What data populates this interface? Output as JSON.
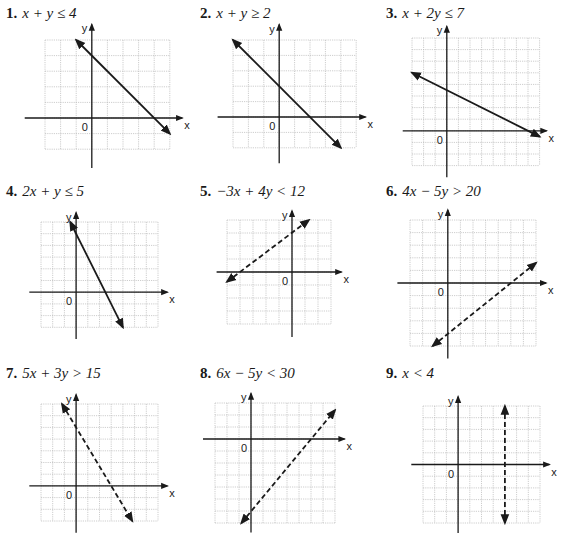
{
  "problems": [
    {
      "number": "1.",
      "expression": "x + y ≤ 4",
      "line_style": "solid",
      "label_pos": [
        6,
        5
      ],
      "grid": {
        "left": 45,
        "top": 40,
        "cell": 15.6,
        "xmin": -3,
        "xmax": 5,
        "ymin": -2,
        "ymax": 5,
        "axis_x_ext": [
          -4.3,
          5.8
        ],
        "axis_y_ext": [
          -3.2,
          6.0
        ]
      },
      "line": {
        "p1": [
          -1,
          5
        ],
        "p2": [
          5,
          -1
        ]
      }
    },
    {
      "number": "2.",
      "expression": "x + y ≥ 2",
      "line_style": "solid",
      "label_pos": [
        200,
        5
      ],
      "grid": {
        "left": 233,
        "top": 40,
        "cell": 15.4,
        "xmin": -3,
        "xmax": 5,
        "ymin": -2,
        "ymax": 5,
        "axis_x_ext": [
          -4.0,
          5.6
        ],
        "axis_y_ext": [
          -3.0,
          6.0
        ]
      },
      "line": {
        "p1": [
          -3,
          5
        ],
        "p2": [
          4,
          -2
        ]
      }
    },
    {
      "number": "3.",
      "expression": "x + 2y ≤ 7",
      "line_style": "solid",
      "label_pos": [
        386,
        5
      ],
      "grid": {
        "left": 412,
        "top": 38,
        "cell": 11.6,
        "xmin": -3,
        "xmax": 8,
        "ymin": -3,
        "ymax": 8,
        "axis_x_ext": [
          -3.8,
          8.6
        ],
        "axis_y_ext": [
          -4.0,
          9.0
        ]
      },
      "line": {
        "p1": [
          -3,
          5
        ],
        "p2": [
          8,
          -0.5
        ]
      }
    },
    {
      "number": "4.",
      "expression": "2x + y ≤ 5",
      "line_style": "solid",
      "label_pos": [
        6,
        183
      ],
      "grid": {
        "left": 41,
        "top": 222,
        "cell": 11.7,
        "xmin": -3,
        "xmax": 7,
        "ymin": -3,
        "ymax": 6,
        "axis_x_ext": [
          -4.0,
          7.8
        ],
        "axis_y_ext": [
          -4.0,
          6.8
        ]
      },
      "line": {
        "p1": [
          -0.5,
          6
        ],
        "p2": [
          4,
          -3
        ]
      }
    },
    {
      "number": "5.",
      "expression": "−3x + 4y < 12",
      "line_style": "dashed",
      "label_pos": [
        200,
        183
      ],
      "grid": {
        "left": 227,
        "top": 220,
        "cell": 13,
        "xmin": -5,
        "xmax": 3,
        "ymin": -4,
        "ymax": 4,
        "axis_x_ext": [
          -5.8,
          3.8
        ],
        "axis_y_ext": [
          -5.0,
          4.7
        ]
      },
      "line": {
        "p1": [
          -5,
          -0.75
        ],
        "p2": [
          1.3,
          4
        ]
      }
    },
    {
      "number": "6.",
      "expression": "4x − 5y > 20",
      "line_style": "dashed",
      "label_pos": [
        386,
        183
      ],
      "grid": {
        "left": 410,
        "top": 220,
        "cell": 12.6,
        "xmin": -3,
        "xmax": 7,
        "ymin": -5,
        "ymax": 5,
        "axis_x_ext": [
          -4.0,
          7.8
        ],
        "axis_y_ext": [
          -6.0,
          5.8
        ]
      },
      "line": {
        "p1": [
          -1.2,
          -5
        ],
        "p2": [
          7,
          1.6
        ]
      }
    },
    {
      "number": "7.",
      "expression": "5x + 3y > 15",
      "line_style": "dashed",
      "label_pos": [
        6,
        365
      ],
      "grid": {
        "left": 41,
        "top": 404,
        "cell": 11.7,
        "xmin": -3,
        "xmax": 7,
        "ymin": -3,
        "ymax": 7,
        "axis_x_ext": [
          -4.0,
          7.8
        ],
        "axis_y_ext": [
          -4.0,
          7.8
        ]
      },
      "line": {
        "p1": [
          -1.2,
          7
        ],
        "p2": [
          4.8,
          -3
        ]
      }
    },
    {
      "number": "8.",
      "expression": "6x − 5y < 30",
      "line_style": "dashed",
      "label_pos": [
        200,
        365
      ],
      "grid": {
        "left": 215,
        "top": 403,
        "cell": 12,
        "xmin": -3,
        "xmax": 7,
        "ymin": -7,
        "ymax": 3,
        "axis_x_ext": [
          -4.0,
          7.8
        ],
        "axis_y_ext": [
          -7.8,
          3.8
        ]
      },
      "line": {
        "p1": [
          -0.8,
          -7
        ],
        "p2": [
          7,
          2.4
        ]
      }
    },
    {
      "number": "9.",
      "expression": "x < 4",
      "line_style": "dashed",
      "label_pos": [
        386,
        365
      ],
      "grid": {
        "left": 423,
        "top": 406,
        "cell": 11.7,
        "xmin": -3,
        "xmax": 7,
        "ymin": -5,
        "ymax": 5,
        "axis_x_ext": [
          -4.0,
          7.8
        ],
        "axis_y_ext": [
          -6.0,
          5.8
        ]
      },
      "line": {
        "p1": [
          4,
          5
        ],
        "p2": [
          4,
          -5
        ]
      }
    }
  ],
  "axes": {
    "x_label": "x",
    "y_label": "y",
    "origin_label": "0"
  },
  "colors": {
    "grid": "#b8b8b8",
    "axis": "#1a1a1a",
    "line": "#1a1a1a"
  }
}
